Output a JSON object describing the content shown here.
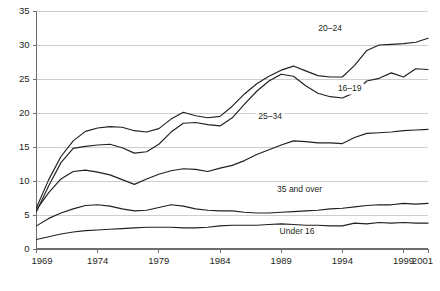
{
  "chart_data": {
    "type": "line",
    "title": "",
    "subtitle": "",
    "xlabel": "",
    "ylabel": "",
    "xlim": [
      1969,
      2001
    ],
    "ylim": [
      0,
      35
    ],
    "grid": true,
    "legend_position": "inline-annotations",
    "y_ticks": [
      0,
      5,
      10,
      15,
      20,
      25,
      30,
      35
    ],
    "y_tick_labels": [
      "0",
      "5",
      "10",
      "15",
      "20",
      "25",
      "30",
      "35"
    ],
    "x_ticks": [
      1969,
      1974,
      1979,
      1984,
      1989,
      1994,
      1999,
      2001
    ],
    "x_tick_labels": [
      "1969",
      "1974",
      "1979",
      "1984",
      "1989",
      "1994",
      "1999",
      "2001"
    ],
    "x": [
      1969,
      1970,
      1971,
      1972,
      1973,
      1974,
      1975,
      1976,
      1977,
      1978,
      1979,
      1980,
      1981,
      1982,
      1983,
      1984,
      1985,
      1986,
      1987,
      1988,
      1989,
      1990,
      1991,
      1992,
      1993,
      1994,
      1995,
      1996,
      1997,
      1998,
      1999,
      2000,
      2001
    ],
    "series": [
      {
        "name": "20-24",
        "label": "20–24",
        "label_x": 1993.0,
        "label_y": 32.0,
        "values": [
          6.1,
          10.2,
          13.6,
          15.9,
          17.3,
          17.8,
          18.0,
          17.9,
          17.4,
          17.2,
          17.7,
          19.1,
          20.1,
          19.6,
          19.3,
          19.5,
          21.0,
          22.8,
          24.3,
          25.4,
          26.3,
          26.9,
          26.2,
          25.5,
          25.3,
          25.3,
          27.0,
          29.2,
          30.0,
          30.1,
          30.2,
          30.4,
          31.0
        ]
      },
      {
        "name": "16-19",
        "label": "16–19",
        "label_x": 1994.6,
        "label_y": 23.3,
        "values": [
          5.5,
          9.3,
          12.7,
          14.8,
          15.1,
          15.3,
          15.4,
          14.9,
          14.1,
          14.3,
          15.4,
          17.2,
          18.5,
          18.6,
          18.3,
          18.1,
          19.3,
          21.3,
          23.2,
          24.7,
          25.7,
          25.4,
          24.0,
          22.9,
          22.4,
          22.2,
          23.0,
          24.7,
          25.1,
          25.9,
          25.3,
          26.5,
          26.4
        ]
      },
      {
        "name": "25-34",
        "label": "25–34",
        "label_x": 1988.1,
        "label_y": 19.1,
        "values": [
          5.8,
          8.3,
          10.3,
          11.4,
          11.6,
          11.3,
          10.9,
          10.2,
          9.5,
          10.3,
          11.0,
          11.5,
          11.8,
          11.7,
          11.4,
          11.9,
          12.3,
          13.0,
          13.9,
          14.6,
          15.3,
          15.9,
          15.8,
          15.6,
          15.6,
          15.5,
          16.4,
          17.0,
          17.1,
          17.2,
          17.4,
          17.5,
          17.6
        ]
      },
      {
        "name": "35 and over",
        "label": "35 and over",
        "label_x": 1990.5,
        "label_y": 8.4,
        "values": [
          3.4,
          4.5,
          5.3,
          5.9,
          6.4,
          6.5,
          6.3,
          5.9,
          5.6,
          5.7,
          6.1,
          6.5,
          6.3,
          5.9,
          5.7,
          5.6,
          5.6,
          5.4,
          5.3,
          5.3,
          5.4,
          5.5,
          5.6,
          5.7,
          5.9,
          6.0,
          6.2,
          6.4,
          6.5,
          6.5,
          6.7,
          6.6,
          6.7
        ]
      },
      {
        "name": "Under 16",
        "label": "Under 16",
        "label_x": 1990.3,
        "label_y": 2.2,
        "values": [
          1.4,
          1.8,
          2.2,
          2.5,
          2.7,
          2.8,
          2.9,
          3.0,
          3.1,
          3.2,
          3.2,
          3.2,
          3.1,
          3.1,
          3.2,
          3.4,
          3.5,
          3.5,
          3.5,
          3.6,
          3.7,
          3.6,
          3.5,
          3.5,
          3.4,
          3.4,
          3.8,
          3.7,
          3.9,
          3.8,
          3.9,
          3.8,
          3.8
        ]
      }
    ],
    "colors": {
      "line": "#231f20",
      "grid": "#b9b9b9",
      "axis": "#6d6d6d",
      "text": "#231f20",
      "background": "#ffffff"
    }
  }
}
